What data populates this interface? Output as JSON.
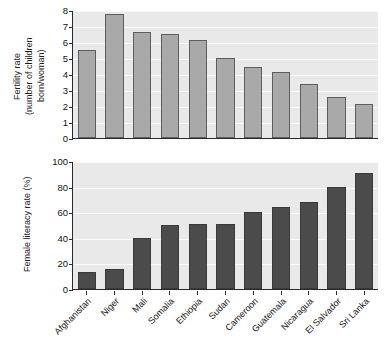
{
  "chart_data": [
    {
      "type": "bar",
      "title": "",
      "ylabel": "Fertility rate (number of children born/woman)",
      "ylabel_line1": "Fertility rate",
      "ylabel_line2": "(number of children",
      "ylabel_line3": "born/woman)",
      "xlabel": "",
      "ylim": [
        0,
        8
      ],
      "yticks": [
        0,
        1,
        2,
        3,
        4,
        5,
        6,
        7,
        8
      ],
      "ytick_labels": [
        "0",
        "1",
        "2",
        "3",
        "4",
        "5",
        "6",
        "7",
        "8"
      ],
      "grid": true,
      "bar_color": "#a9a9a9",
      "bar_edge_color": "#5d5d5d",
      "plot_background": "#e9e9e9",
      "categories": [
        "Afghanistan",
        "Niger",
        "Mali",
        "Somalia",
        "Ethiopia",
        "Sudan",
        "Cameroon",
        "Guatemala",
        "Nicaragua",
        "El Salvador",
        "Sri Lanka"
      ],
      "values": [
        5.5,
        7.75,
        6.6,
        6.5,
        6.15,
        5.0,
        4.45,
        4.1,
        3.4,
        2.55,
        2.1
      ]
    },
    {
      "type": "bar",
      "title": "",
      "ylabel": "Female literacy rate (%)",
      "xlabel": "",
      "ylim": [
        0,
        100
      ],
      "yticks": [
        0,
        20,
        40,
        60,
        80,
        100
      ],
      "ytick_labels": [
        "0",
        "20",
        "40",
        "60",
        "80",
        "100"
      ],
      "grid": true,
      "bar_color": "#4b4b4b",
      "bar_edge_color": "#3a3a3a",
      "plot_background": "#e9e9e9",
      "categories": [
        "Afghanistan",
        "Niger",
        "Mali",
        "Somalia",
        "Ethiopia",
        "Sudan",
        "Cameroon",
        "Guatemala",
        "Nicaragua",
        "El Salvador",
        "Sri Lanka"
      ],
      "values": [
        13,
        16,
        40,
        50,
        51,
        51,
        60,
        64,
        68,
        80,
        91
      ]
    }
  ],
  "top_chart": {
    "ylabel_line1": "Fertility rate",
    "ylabel_line2": "(number of children",
    "ylabel_line3": "born/woman)"
  },
  "bottom_chart": {
    "ylabel": "Female literacy rate (%)"
  }
}
